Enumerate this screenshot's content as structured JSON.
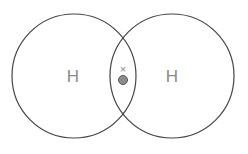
{
  "diagram": {
    "title": "",
    "atoms": [
      {
        "symbol": "H",
        "cx": 74,
        "cy": 76,
        "r": 62
      },
      {
        "symbol": "H",
        "cx": 172,
        "cy": 76,
        "r": 62
      }
    ],
    "shared_electrons": [
      {
        "type": "cross",
        "symbol": "×",
        "x": 123,
        "y": 70
      },
      {
        "type": "dot",
        "x": 123,
        "y": 80,
        "r": 4.5,
        "fill": "#8c8c8c",
        "stroke": "#555555"
      }
    ],
    "colors": {
      "circle_stroke": "#444444",
      "label": "#8a8a8a"
    }
  }
}
